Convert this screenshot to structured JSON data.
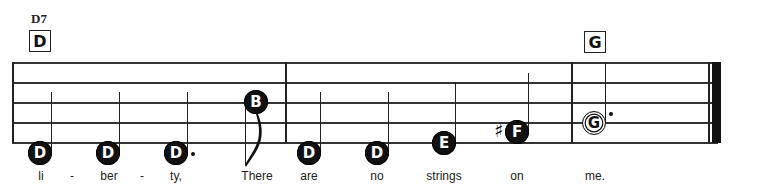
{
  "chords": [
    {
      "name": "D7",
      "box": "D",
      "x": 29
    },
    {
      "name": "",
      "box": "G",
      "x": 584
    }
  ],
  "staff": {
    "left": 12,
    "right": 721,
    "lines_y": [
      62,
      82,
      102,
      122,
      142
    ]
  },
  "barlines_x": [
    285,
    571
  ],
  "final_barline": {
    "thin_x": 708,
    "thick_x": 712
  },
  "notes": [
    {
      "letter": "D",
      "cx": 40,
      "cy": 153,
      "type": "quarter",
      "stem": "up",
      "lyric": "li"
    },
    {
      "letter": "D",
      "cx": 108,
      "cy": 153,
      "type": "quarter",
      "stem": "up",
      "lyric": "ber"
    },
    {
      "letter": "D",
      "cx": 176,
      "cy": 153,
      "type": "dotted-quarter",
      "stem": "up",
      "lyric": "ty,"
    },
    {
      "letter": "B",
      "cx": 256,
      "cy": 102,
      "type": "eighth",
      "stem": "down",
      "lyric": "There"
    },
    {
      "letter": "D",
      "cx": 309,
      "cy": 153,
      "type": "quarter",
      "stem": "up",
      "lyric": "are"
    },
    {
      "letter": "D",
      "cx": 377,
      "cy": 153,
      "type": "quarter",
      "stem": "up",
      "lyric": "no"
    },
    {
      "letter": "E",
      "cx": 444,
      "cy": 143,
      "type": "quarter",
      "stem": "up",
      "lyric": "strings"
    },
    {
      "letter": "F",
      "accidental": "♯",
      "cx": 517,
      "cy": 132,
      "type": "quarter",
      "stem": "up",
      "lyric": "on"
    },
    {
      "letter": "G",
      "cx": 594,
      "cy": 123,
      "type": "dotted-half",
      "stem": "up",
      "lyric": "me."
    }
  ],
  "hyphens": [
    {
      "text": "-",
      "x": 72
    },
    {
      "text": "-",
      "x": 142
    }
  ]
}
